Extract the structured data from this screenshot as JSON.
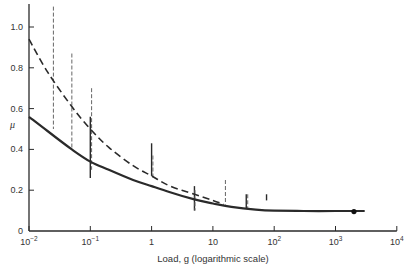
{
  "chart_data": {
    "type": "line",
    "title": "",
    "xlabel": "Load, g (logarithmic scale)",
    "ylabel": "μ",
    "xscale": "log",
    "xlim": [
      0.01,
      10000
    ],
    "ylim": [
      0,
      1.1
    ],
    "grid": false,
    "legend": null,
    "x_ticks": [
      {
        "value": 0.01,
        "label_base": "10",
        "label_exp": "−2"
      },
      {
        "value": 0.1,
        "label_base": "10",
        "label_exp": "−1"
      },
      {
        "value": 1,
        "label_base": "1",
        "label_exp": ""
      },
      {
        "value": 10,
        "label_base": "10",
        "label_exp": ""
      },
      {
        "value": 100,
        "label_base": "10",
        "label_exp": "2"
      },
      {
        "value": 1000,
        "label_base": "10",
        "label_exp": "3"
      },
      {
        "value": 10000,
        "label_base": "10",
        "label_exp": "4"
      }
    ],
    "y_ticks": [
      {
        "value": 0,
        "label": "0"
      },
      {
        "value": 0.2,
        "label": "0.2"
      },
      {
        "value": 0.4,
        "label": "0.4"
      },
      {
        "value": 0.6,
        "label": "0.6"
      },
      {
        "value": 0.8,
        "label": "0.8"
      },
      {
        "value": 1.0,
        "label": "1.0"
      }
    ],
    "series": [
      {
        "name": "solid curve",
        "style": "solid",
        "x": [
          0.01,
          0.02,
          0.05,
          0.1,
          0.2,
          0.5,
          1,
          2,
          5,
          10,
          20,
          50,
          100,
          300,
          1000,
          3000
        ],
        "y": [
          0.56,
          0.49,
          0.4,
          0.34,
          0.3,
          0.25,
          0.22,
          0.19,
          0.155,
          0.135,
          0.118,
          0.105,
          0.1,
          0.098,
          0.098,
          0.098
        ]
      },
      {
        "name": "dashed curve",
        "style": "dashed",
        "x": [
          0.01,
          0.02,
          0.05,
          0.1,
          0.2,
          0.5,
          1,
          2,
          5,
          10,
          15
        ],
        "y": [
          0.94,
          0.78,
          0.61,
          0.5,
          0.41,
          0.32,
          0.27,
          0.22,
          0.18,
          0.15,
          0.13
        ]
      }
    ],
    "error_bars": [
      {
        "x": 0.025,
        "ymin": 0.5,
        "ymax": 1.1,
        "style": "dashed"
      },
      {
        "x": 0.05,
        "ymin": 0.4,
        "ymax": 0.87,
        "style": "dashed"
      },
      {
        "x": 0.1,
        "ymin": 0.26,
        "ymax": 0.56,
        "style": "solid"
      },
      {
        "x": 0.105,
        "ymin": 0.3,
        "ymax": 0.7,
        "style": "dashed"
      },
      {
        "x": 1,
        "ymin": 0.27,
        "ymax": 0.43,
        "style": "solid"
      },
      {
        "x": 1.05,
        "ymin": 0.26,
        "ymax": 0.37,
        "style": "dashed"
      },
      {
        "x": 5,
        "ymin": 0.1,
        "ymax": 0.22,
        "style": "solid"
      },
      {
        "x": 5.1,
        "ymin": 0.1,
        "ymax": 0.2,
        "style": "dashed"
      },
      {
        "x": 16,
        "ymin": 0.13,
        "ymax": 0.25,
        "style": "dashed"
      },
      {
        "x": 35,
        "ymin": 0.11,
        "ymax": 0.18,
        "style": "solid"
      },
      {
        "x": 37,
        "ymin": 0.11,
        "ymax": 0.18,
        "style": "dashed"
      },
      {
        "x": 75,
        "ymin": 0.15,
        "ymax": 0.18,
        "style": "solid"
      }
    ],
    "points": [
      {
        "x": 2000,
        "y": 0.095,
        "marker": "filled-circle"
      }
    ]
  }
}
